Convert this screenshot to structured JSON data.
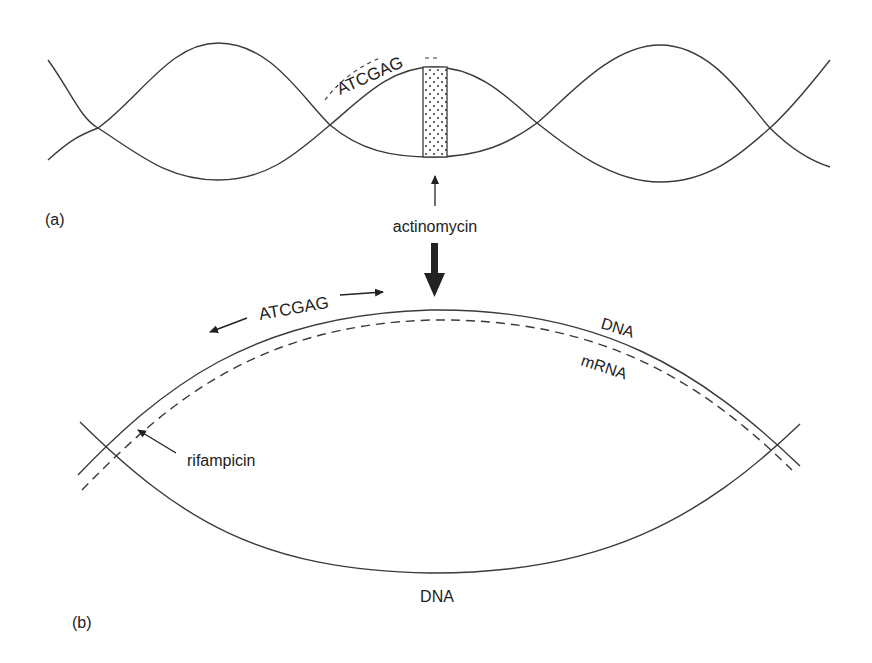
{
  "figure": {
    "panel_a": {
      "label": "(a)",
      "sequence": "ATCGAG",
      "drug": "actinomycin",
      "description": "DNA double helix with actinomycin intercalated (stippled block)"
    },
    "panel_b": {
      "label": "(b)",
      "sequence": "ATCGAG",
      "upper_strand_label": "DNA",
      "mrna_label": "mRNA",
      "lower_strand_label": "DNA",
      "drug": "rifampicin"
    },
    "colors": {
      "line": "#3a3a3a",
      "text": "#222222",
      "background": "#ffffff"
    }
  }
}
